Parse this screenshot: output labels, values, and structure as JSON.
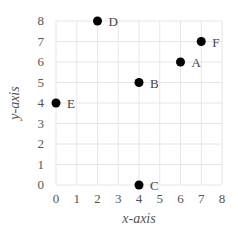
{
  "chart_data": {
    "type": "scatter",
    "title": "",
    "xlabel": "x-axis",
    "ylabel": "y-axis",
    "xlim": [
      0,
      8
    ],
    "ylim": [
      0,
      8
    ],
    "x_ticks": [
      "0",
      "1",
      "2",
      "3",
      "4",
      "5",
      "6",
      "7",
      "8"
    ],
    "y_ticks": [
      "0",
      "1",
      "2",
      "3",
      "4",
      "5",
      "6",
      "7",
      "8"
    ],
    "grid": true,
    "legend": null,
    "points": [
      {
        "label": "A",
        "x": 6,
        "y": 6
      },
      {
        "label": "B",
        "x": 4,
        "y": 5
      },
      {
        "label": "C",
        "x": 4,
        "y": 0
      },
      {
        "label": "D",
        "x": 2,
        "y": 8
      },
      {
        "label": "E",
        "x": 0,
        "y": 4
      },
      {
        "label": "F",
        "x": 7,
        "y": 7
      }
    ],
    "colors": {
      "point": "#000000",
      "grid": "#e6e6e6",
      "text": "#555555"
    }
  }
}
